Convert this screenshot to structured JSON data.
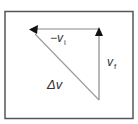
{
  "diagram": {
    "frame": {
      "stroke": "#555555"
    },
    "vectors": [
      {
        "id": "neg-vi",
        "label_main": "−v",
        "label_sub": "i",
        "from": [
          99,
          29
        ],
        "to": [
          30,
          29
        ]
      },
      {
        "id": "vf",
        "label_main": "v",
        "label_sub": "f",
        "from": [
          99,
          100
        ],
        "to": [
          99,
          29
        ]
      },
      {
        "id": "delta-v",
        "label_main": "Δv",
        "label_sub": "",
        "from": [
          99,
          100
        ],
        "to": [
          30,
          29
        ]
      }
    ],
    "colors": {
      "line": "#888888",
      "arrowhead": "#111111",
      "text": "#333333",
      "background": "#ffffff"
    }
  }
}
